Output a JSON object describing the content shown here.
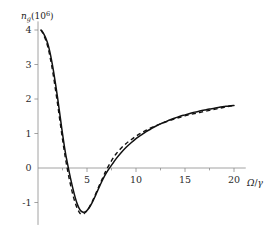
{
  "chart_data": {
    "type": "line",
    "title": "",
    "subtitle": "",
    "xlabel": "Ω/γ",
    "ylabel": "n_g(10^6)",
    "ylabel_parts": {
      "symbol": "n",
      "subscript": "g",
      "factor_open": "(10",
      "exponent": "6",
      "factor_close": ")"
    },
    "xlabel_parts": {
      "omega": "Ω",
      "slash": "/",
      "gamma": "γ"
    },
    "xlim": [
      0,
      21.2
    ],
    "ylim": [
      -1.65,
      4.25
    ],
    "xticks": [
      5,
      10,
      15,
      20
    ],
    "xtick_labels": [
      "5",
      "10",
      "15",
      "20"
    ],
    "x_minor_ticks": [
      2.5,
      7.5,
      12.5,
      17.5
    ],
    "yticks": [
      -1,
      0,
      1,
      2,
      3,
      4
    ],
    "ytick_labels": [
      "-1",
      "0",
      "1",
      "2",
      "3",
      "4"
    ],
    "grid": false,
    "legend": "none",
    "axis_color": "#8c8c8c",
    "curve_color": "#111111",
    "series": [
      {
        "name": "solid",
        "style": "solid",
        "points": [
          [
            0.3,
            4.0
          ],
          [
            0.45,
            3.95
          ],
          [
            0.6,
            3.88
          ],
          [
            0.8,
            3.76
          ],
          [
            1.0,
            3.6
          ],
          [
            1.2,
            3.38
          ],
          [
            1.4,
            3.1
          ],
          [
            1.6,
            2.78
          ],
          [
            1.8,
            2.42
          ],
          [
            2.0,
            2.03
          ],
          [
            2.2,
            1.62
          ],
          [
            2.4,
            1.2
          ],
          [
            2.6,
            0.8
          ],
          [
            2.8,
            0.44
          ],
          [
            3.0,
            0.14
          ],
          [
            3.2,
            -0.14
          ],
          [
            3.4,
            -0.4
          ],
          [
            3.6,
            -0.64
          ],
          [
            3.8,
            -0.86
          ],
          [
            4.0,
            -1.04
          ],
          [
            4.2,
            -1.17
          ],
          [
            4.4,
            -1.25
          ],
          [
            4.6,
            -1.28
          ],
          [
            4.8,
            -1.27
          ],
          [
            5.0,
            -1.23
          ],
          [
            5.2,
            -1.16
          ],
          [
            5.4,
            -1.07
          ],
          [
            5.6,
            -0.96
          ],
          [
            5.8,
            -0.84
          ],
          [
            6.0,
            -0.71
          ],
          [
            6.3,
            -0.52
          ],
          [
            6.6,
            -0.34
          ],
          [
            6.9,
            -0.18
          ],
          [
            7.2,
            -0.04
          ],
          [
            7.4,
            0.04
          ],
          [
            7.7,
            0.16
          ],
          [
            8.0,
            0.28
          ],
          [
            8.5,
            0.45
          ],
          [
            9.0,
            0.6
          ],
          [
            9.5,
            0.73
          ],
          [
            10.0,
            0.85
          ],
          [
            10.5,
            0.95
          ],
          [
            11.0,
            1.05
          ],
          [
            11.5,
            1.13
          ],
          [
            12.0,
            1.21
          ],
          [
            12.5,
            1.28
          ],
          [
            13.0,
            1.34
          ],
          [
            13.5,
            1.4
          ],
          [
            14.0,
            1.45
          ],
          [
            14.5,
            1.5
          ],
          [
            15.0,
            1.54
          ],
          [
            15.5,
            1.58
          ],
          [
            16.0,
            1.62
          ],
          [
            16.5,
            1.65
          ],
          [
            17.0,
            1.68
          ],
          [
            17.5,
            1.71
          ],
          [
            18.0,
            1.73
          ],
          [
            18.5,
            1.76
          ],
          [
            19.0,
            1.78
          ],
          [
            19.5,
            1.8
          ],
          [
            20.0,
            1.81
          ]
        ]
      },
      {
        "name": "dashed",
        "style": "dashed",
        "points": [
          [
            0.3,
            4.0
          ],
          [
            0.45,
            3.93
          ],
          [
            0.6,
            3.84
          ],
          [
            0.8,
            3.7
          ],
          [
            1.0,
            3.51
          ],
          [
            1.2,
            3.26
          ],
          [
            1.4,
            2.96
          ],
          [
            1.6,
            2.62
          ],
          [
            1.8,
            2.24
          ],
          [
            2.0,
            1.85
          ],
          [
            2.2,
            1.44
          ],
          [
            2.4,
            1.03
          ],
          [
            2.6,
            0.64
          ],
          [
            2.8,
            0.28
          ],
          [
            3.0,
            -0.04
          ],
          [
            3.2,
            -0.33
          ],
          [
            3.4,
            -0.59
          ],
          [
            3.6,
            -0.82
          ],
          [
            3.8,
            -1.01
          ],
          [
            4.0,
            -1.17
          ],
          [
            4.2,
            -1.28
          ],
          [
            4.35,
            -1.33
          ],
          [
            4.5,
            -1.34
          ],
          [
            4.7,
            -1.32
          ],
          [
            4.9,
            -1.27
          ],
          [
            5.1,
            -1.2
          ],
          [
            5.3,
            -1.1
          ],
          [
            5.5,
            -0.99
          ],
          [
            5.7,
            -0.87
          ],
          [
            5.9,
            -0.74
          ],
          [
            6.2,
            -0.54
          ],
          [
            6.5,
            -0.35
          ],
          [
            6.8,
            -0.16
          ],
          [
            6.9,
            -0.1
          ],
          [
            7.1,
            0.01
          ],
          [
            7.4,
            0.16
          ],
          [
            7.7,
            0.3
          ],
          [
            8.0,
            0.42
          ],
          [
            8.5,
            0.58
          ],
          [
            9.0,
            0.71
          ],
          [
            9.5,
            0.82
          ],
          [
            10.0,
            0.92
          ],
          [
            10.5,
            1.01
          ],
          [
            11.0,
            1.09
          ],
          [
            11.5,
            1.16
          ],
          [
            12.0,
            1.22
          ],
          [
            12.5,
            1.28
          ],
          [
            13.0,
            1.33
          ],
          [
            13.5,
            1.38
          ],
          [
            14.0,
            1.43
          ],
          [
            14.5,
            1.47
          ],
          [
            15.0,
            1.51
          ],
          [
            15.5,
            1.55
          ],
          [
            16.0,
            1.58
          ],
          [
            16.5,
            1.61
          ],
          [
            17.0,
            1.64
          ],
          [
            17.5,
            1.67
          ],
          [
            18.0,
            1.7
          ],
          [
            18.5,
            1.73
          ],
          [
            19.0,
            1.76
          ],
          [
            19.5,
            1.79
          ],
          [
            20.0,
            1.81
          ]
        ]
      }
    ]
  }
}
